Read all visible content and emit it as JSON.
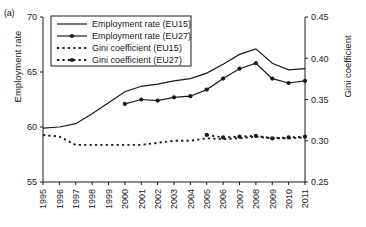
{
  "panel": {
    "label": "(a)"
  },
  "chart_data": {
    "type": "line",
    "title": "",
    "xlabel": "",
    "ylabel": "Employment rate",
    "ylabel_right": "Gini coefficient",
    "x": [
      1995,
      1996,
      1997,
      1998,
      1999,
      2000,
      2001,
      2002,
      2003,
      2004,
      2005,
      2006,
      2007,
      2008,
      2009,
      2010,
      2011
    ],
    "xtick_labels": [
      "1995",
      "1996",
      "1997",
      "1998",
      "1999",
      "2000",
      "2001",
      "2002",
      "2003",
      "2004",
      "2005",
      "2006",
      "2007",
      "2008",
      "2009",
      "2010",
      "2011"
    ],
    "ylim": [
      55,
      70
    ],
    "ytick_labels": [
      "55",
      "60",
      "65",
      "70"
    ],
    "ytick_values": [
      55,
      60,
      65,
      70
    ],
    "ylim_right": [
      0.25,
      0.45
    ],
    "ytick_labels_right": [
      "0.25",
      "0.30",
      "0.35",
      "0.40",
      "0.45"
    ],
    "ytick_values_right": [
      0.25,
      0.3,
      0.35,
      0.4,
      0.45
    ],
    "grid": false,
    "legend_position": "upper-left-inside",
    "series": [
      {
        "name": "Employment rate (EU15)",
        "axis": "left",
        "style": "solid",
        "markers": false,
        "x": [
          1995,
          1996,
          1997,
          1998,
          1999,
          2000,
          2001,
          2002,
          2003,
          2004,
          2005,
          2006,
          2007,
          2008,
          2009,
          2010,
          2011
        ],
        "values": [
          59.9,
          60.0,
          60.3,
          61.2,
          62.2,
          63.2,
          63.7,
          63.9,
          64.2,
          64.4,
          64.9,
          65.7,
          66.6,
          67.1,
          65.8,
          65.2,
          65.3
        ]
      },
      {
        "name": "Employment rate (EU27)",
        "axis": "left",
        "style": "solid",
        "markers": true,
        "x": [
          2000,
          2001,
          2002,
          2003,
          2004,
          2005,
          2006,
          2007,
          2008,
          2009,
          2010,
          2011
        ],
        "values": [
          62.1,
          62.5,
          62.4,
          62.7,
          62.8,
          63.4,
          64.4,
          65.3,
          65.8,
          64.4,
          64.0,
          64.2
        ]
      },
      {
        "name": "Gini coefficient (EU15)",
        "axis": "right",
        "style": "dotted",
        "markers": false,
        "x": [
          1995,
          1996,
          1997,
          1998,
          1999,
          2000,
          2001,
          2003,
          2004,
          2005,
          2006,
          2007,
          2008,
          2009,
          2010,
          2011
        ],
        "values": [
          0.307,
          0.305,
          0.295,
          0.295,
          0.295,
          0.295,
          0.295,
          0.3,
          0.3,
          0.303,
          0.302,
          0.303,
          0.305,
          0.303,
          0.303,
          0.304
        ]
      },
      {
        "name": "Gini coefficient (EU27)",
        "axis": "right",
        "style": "dotted",
        "markers": true,
        "x": [
          2005,
          2006,
          2007,
          2008,
          2009,
          2010,
          2011
        ],
        "values": [
          0.307,
          0.304,
          0.305,
          0.306,
          0.303,
          0.304,
          0.305
        ]
      }
    ]
  },
  "legend": {
    "items": [
      {
        "label": "Employment rate (EU15)",
        "style": "solid",
        "marker": false
      },
      {
        "label": "Employment rate (EU27)",
        "style": "solid",
        "marker": true
      },
      {
        "label": "Gini coefficient (EU15)",
        "style": "dotted",
        "marker": false
      },
      {
        "label": "Gini coefficient (EU27)",
        "style": "dotted",
        "marker": true
      }
    ]
  },
  "colors": {
    "ink": "#1a1a1a",
    "background": "#ffffff"
  }
}
